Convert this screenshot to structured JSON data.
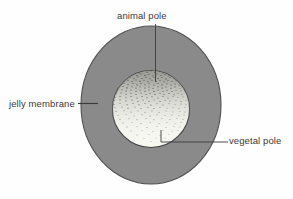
{
  "figure": {
    "background_color": "#fefefe",
    "width": 293,
    "height": 199
  },
  "structures": {
    "jelly_membrane": {
      "name": "jelly membrane",
      "shape": "outer-circle",
      "fill_color": "#8a8a8a",
      "stroke_color": "#4a4a4a",
      "center_x": 151,
      "center_y": 105,
      "radius_x": 70,
      "radius_y": 79
    },
    "egg_cell": {
      "name": "egg cell",
      "shape": "inner-circle",
      "fill_color": "#f7f7f2",
      "stroke_color": "#3a3a3a",
      "center_x": 151,
      "center_y": 109,
      "radius": 39,
      "stipple_description": "dense dark pigment granules at animal pole grading to sparse at vegetal pole"
    }
  },
  "labels": {
    "animal_pole": {
      "text": "animal pole",
      "leader": "vertical line pointing down into top of egg cell"
    },
    "jelly_membrane": {
      "text": "jelly membrane",
      "leader": "horizontal line pointing right to jelly membrane"
    },
    "vegetal_pole": {
      "text": "vegetal pole",
      "leader": "horizontal line with upward stub pointing into bottom of egg cell"
    }
  },
  "colors": {
    "membrane_gray": "#8a8a8a",
    "egg_light": "#f7f7f2",
    "pigment_dark": "#404040",
    "line": "#3a3a3a",
    "text": "#3a3a3a"
  }
}
